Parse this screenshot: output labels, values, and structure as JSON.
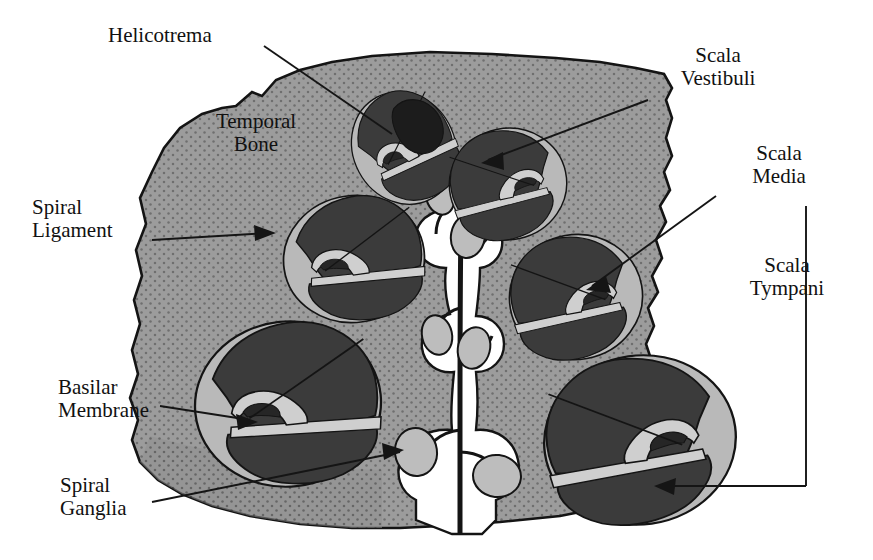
{
  "figure": {
    "type": "anatomical-diagram",
    "canvas": {
      "width": 873,
      "height": 560
    },
    "background_color": "#ffffff"
  },
  "palette": {
    "paper_white": "#ffffff",
    "bone_gray": "#9c9c9c",
    "bone_stipple_dot": "#6f6f6f",
    "scala_dark": "#3b3b3b",
    "scala_dark_2": "#454545",
    "helicotrema_black": "#1c1c1c",
    "spiral_ligament_gray": "#b9b9b9",
    "membrane_light": "#cfcfcf",
    "ganglion_gray": "#bdbdbd",
    "outline_black": "#141414",
    "leader_line": "#151515"
  },
  "labels": [
    {
      "id": "helicotrema",
      "text": "Helicotrema",
      "x": 108,
      "y": 24,
      "align": "left",
      "leader": "line from label down-right into apical (top-left) cochlear turn",
      "pointer_type": "plain-line"
    },
    {
      "id": "temporal-bone",
      "text": "Temporal\nBone",
      "x": 186,
      "y": 110,
      "align": "center",
      "leader": "none",
      "pointer_type": "none"
    },
    {
      "id": "spiral-ligament",
      "text": "Spiral\nLigament",
      "x": 32,
      "y": 196,
      "align": "left",
      "leader": "horizontal arrow pointing right into the light gray ring of the left middle turn",
      "pointer_type": "arrow"
    },
    {
      "id": "basilar-membrane",
      "text": "Basilar\nMembrane",
      "x": 58,
      "y": 376,
      "align": "left",
      "leader": "line right into the basilar membrane of the large lower-left turn",
      "pointer_type": "arrow"
    },
    {
      "id": "spiral-ganglia",
      "text": "Spiral\nGanglia",
      "x": 60,
      "y": 474,
      "align": "left",
      "leader": "line up-right to the light gray ganglion oval beside the modiolus",
      "pointer_type": "arrow"
    },
    {
      "id": "scala-vestibuli",
      "text": "Scala\nVestibuli",
      "x": 668,
      "y": 44,
      "align": "center",
      "leader": "line down-left into the upper chamber of the top-right turn",
      "pointer_type": "arrow"
    },
    {
      "id": "scala-media",
      "text": "Scala\nMedia",
      "x": 744,
      "y": 142,
      "align": "center",
      "leader": "line down-left into the wedge-shaped scala media of the right middle turn",
      "pointer_type": "arrow"
    },
    {
      "id": "scala-tympani",
      "text": "Scala\nTympani",
      "x": 742,
      "y": 254,
      "align": "center",
      "leader": "vertical bracket down then horizontal line left into the lower chamber of the bottom-right turn",
      "pointer_type": "bracket-arrow"
    }
  ],
  "structures": {
    "temporal_bone": {
      "name": "Temporal Bone",
      "fill": "#9c9c9c",
      "texture": "fine dotted stipple"
    },
    "cochlear_turns": [
      {
        "id": "turn-apex-left",
        "cx": 404,
        "cy": 148,
        "rx": 51,
        "ry": 58,
        "rotation": -28,
        "mirrored": false,
        "note": "apical turn containing the helicotrema (black region)"
      },
      {
        "id": "turn-top-right",
        "cx": 508,
        "cy": 184,
        "rx": 58,
        "ry": 55,
        "rotation": -12,
        "mirrored": true,
        "note": "scala vestibuli labelled here"
      },
      {
        "id": "turn-mid-left",
        "cx": 354,
        "cy": 259,
        "rx": 70,
        "ry": 63,
        "rotation": -8,
        "mirrored": false,
        "note": "spiral ligament labelled here"
      },
      {
        "id": "turn-mid-right",
        "cx": 576,
        "cy": 297,
        "rx": 66,
        "ry": 62,
        "rotation": -10,
        "mirrored": true,
        "note": "scala media labelled here"
      },
      {
        "id": "turn-low-left",
        "cx": 288,
        "cy": 404,
        "rx": 93,
        "ry": 82,
        "rotation": -6,
        "mirrored": false,
        "note": "basal turn, basilar membrane labelled here"
      },
      {
        "id": "turn-low-right",
        "cx": 640,
        "cy": 440,
        "rx": 96,
        "ry": 84,
        "rotation": -8,
        "mirrored": true,
        "note": "basal turn, scala tympani labelled here"
      }
    ],
    "modiolus": {
      "name": "modiolus with cochlear nerve",
      "fill": "#ffffff",
      "nerve_color": "#141414",
      "ganglia_count": 7,
      "ganglion_fill": "#bdbdbd"
    }
  }
}
